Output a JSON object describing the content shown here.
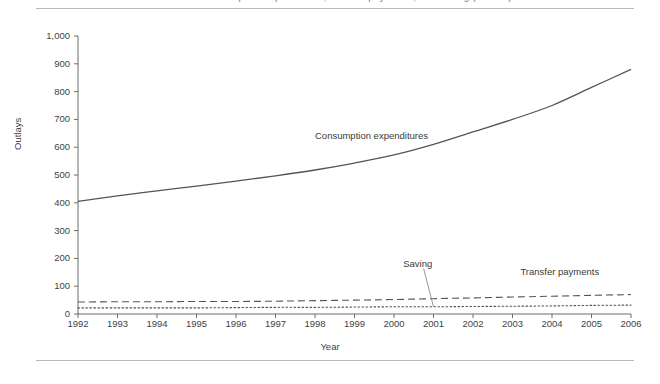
{
  "figure": {
    "clipped_title": "Consumption expenditures, transfer payments, and saving (billions)",
    "ylabel": "Outlays",
    "xlabel": "Year"
  },
  "chart_data": {
    "type": "line",
    "title": "",
    "xlabel": "Year",
    "ylabel": "Outlays",
    "xlim": [
      1992,
      2006
    ],
    "ylim": [
      0,
      1000
    ],
    "grid": false,
    "legend": "inline-annotations",
    "categories": [
      1992,
      1993,
      1994,
      1995,
      1996,
      1997,
      1998,
      1999,
      2000,
      2001,
      2002,
      2003,
      2004,
      2005,
      2006
    ],
    "yticks": [
      "0",
      "100",
      "200",
      "300",
      "400",
      "500",
      "600",
      "700",
      "800",
      "900",
      "1,000"
    ],
    "xticks": [
      "1992",
      "1993",
      "1994",
      "1995",
      "1996",
      "1997",
      "1998",
      "1999",
      "2000",
      "2001",
      "2002",
      "2003",
      "2004",
      "2005",
      "2006"
    ],
    "series": [
      {
        "name": "Consumption expenditures",
        "style": "solid",
        "color": "#555555",
        "values": [
          405,
          425,
          443,
          460,
          478,
          497,
          518,
          543,
          572,
          610,
          655,
          700,
          750,
          815,
          880
        ],
        "label_x": 1998.0,
        "label_y": 640
      },
      {
        "name": "Transfer payments",
        "style": "dashed",
        "color": "#555555",
        "values": [
          43,
          44,
          44,
          45,
          45,
          46,
          48,
          50,
          52,
          55,
          58,
          61,
          64,
          67,
          70
        ],
        "label_x": 2003.2,
        "label_y": 150
      },
      {
        "name": "Saving",
        "style": "dotted",
        "color": "#555555",
        "values": [
          22,
          22,
          22,
          22,
          23,
          24,
          24,
          25,
          26,
          26,
          27,
          28,
          29,
          31,
          32
        ],
        "label_x": 2000.6,
        "label_y": 180
      }
    ]
  }
}
